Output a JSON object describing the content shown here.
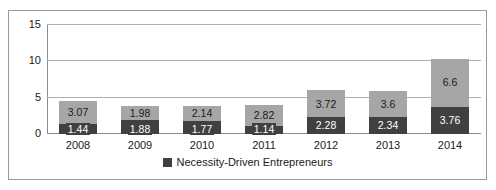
{
  "chart_data": {
    "type": "bar",
    "stacked": true,
    "title": "",
    "xlabel": "",
    "ylabel": "",
    "ylim": [
      0,
      15
    ],
    "yticks": [
      0,
      5,
      10,
      15
    ],
    "grid": true,
    "legend_position": "bottom",
    "categories": [
      "2008",
      "2009",
      "2010",
      "2011",
      "2012",
      "2013",
      "2014"
    ],
    "series": [
      {
        "name": "Necessity-Driven Entrepreneurs",
        "color": "#404040",
        "stack_position": "bottom",
        "values": [
          1.44,
          1.88,
          1.77,
          1.14,
          2.28,
          2.34,
          3.76
        ],
        "labels": [
          "1.44",
          "1.88",
          "1.77",
          "1.14",
          "2.28",
          "2.34",
          "3.76"
        ]
      },
      {
        "name": "",
        "color": "#a6a6a6",
        "stack_position": "top",
        "values": [
          3.07,
          1.98,
          2.14,
          2.82,
          3.72,
          3.6,
          6.6
        ],
        "labels": [
          "3.07",
          "1.98",
          "2.14",
          "2.82",
          "3.72",
          "3.6",
          "6.6"
        ]
      }
    ],
    "totals": [
      4.51,
      3.86,
      3.91,
      3.96,
      6.0,
      5.94,
      10.36
    ]
  },
  "axis": {
    "ytick_labels": [
      "0",
      "5",
      "10",
      "15"
    ]
  },
  "legend": {
    "entries": [
      {
        "label": "Necessity-Driven Entrepreneurs",
        "color": "#404040"
      }
    ]
  }
}
